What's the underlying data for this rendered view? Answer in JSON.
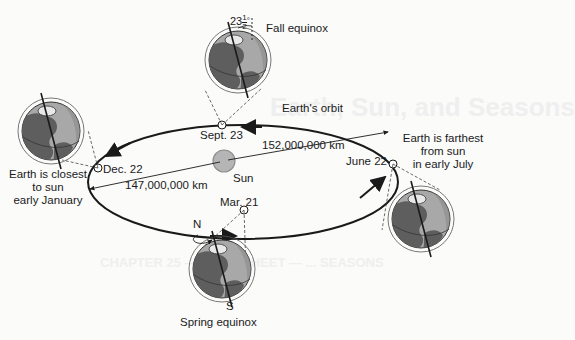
{
  "diagram": {
    "title_background_bleed": "Earth, Sun, and Seasons",
    "bleed_lines": [
      "CHAPTER 25 — SKILL SHEET — ... SEASONS"
    ],
    "orbit_label": "Earth's orbit",
    "sun_label": "Sun",
    "tilt": {
      "whole": "23",
      "num": "1",
      "den": "2",
      "unit": "°"
    },
    "positions": [
      {
        "id": "sept",
        "date": "Sept. 23",
        "caption": "Fall equinox"
      },
      {
        "id": "june",
        "date": "June 22",
        "caption_lines": [
          "Earth is farthest",
          "from sun",
          "in early July"
        ]
      },
      {
        "id": "mar",
        "date": "Mar. 21",
        "caption": "Spring equinox"
      },
      {
        "id": "dec",
        "date": "Dec. 22",
        "caption_lines": [
          "Earth is closest",
          "to sun",
          "early January"
        ]
      }
    ],
    "distances": {
      "aphelion": "152,000,000 km",
      "perihelion": "147,000,000 km"
    },
    "poles": {
      "north": "N",
      "south": "S"
    },
    "colors": {
      "ink": "#1a1a1a",
      "globe_ocean": "#a8a8a8",
      "globe_land": "#5e5e5e",
      "globe_night": "#8a8a8a",
      "sun_fill": "#b5b5b5",
      "background": "#fbfbfa"
    }
  }
}
